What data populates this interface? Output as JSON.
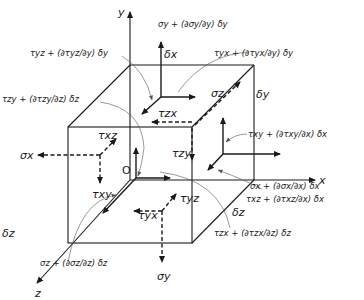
{
  "diagram": {
    "axes": {
      "x": "x",
      "y": "y",
      "z": "z",
      "origin": "O"
    },
    "dimensions": {
      "dx": "δx",
      "dy": "δy",
      "dz": "δz"
    },
    "negative_face_stresses": {
      "sigma_x": "σx",
      "sigma_y": "σy",
      "sigma_z": "σz",
      "tau_xy": "τxy",
      "tau_xz": "τxz",
      "tau_yx": "τyx",
      "tau_yz": "τyz",
      "tau_zx": "τzx",
      "tau_zy": "τzy"
    },
    "positive_face_stresses": {
      "sigma_y": "σy + (∂σy/∂y) δy",
      "sigma_x": "σx + (∂σx/∂x) δx",
      "sigma_z": "σz + (∂σz/∂z) δz",
      "tau_yz": "τyz + (∂τyz/∂y) δy",
      "tau_zy": "τzy + (∂τzy/∂z) δz",
      "tau_yx": "τyx + (∂τyx/∂y) δy",
      "tau_xy": "τxy + (∂τxy/∂x) δx",
      "tau_xz": "τxz + (∂τxz/∂x) δx",
      "tau_zx": "τzx + (∂τzx/∂z) δz"
    },
    "colors": {
      "line": "#1a1a1a",
      "leader": "#555555",
      "background": "#ffffff"
    }
  }
}
